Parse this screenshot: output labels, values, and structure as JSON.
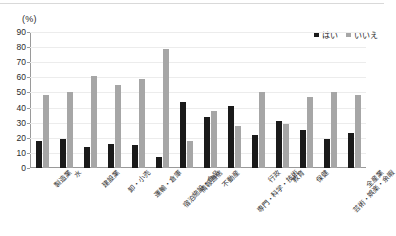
{
  "chart_data": {
    "type": "bar",
    "title": "",
    "subtitle": "",
    "unit_caption": "(%)",
    "xlabel": "",
    "ylabel": "",
    "ylim": [
      0,
      90
    ],
    "ytick_step": 10,
    "yticks": [
      90,
      80,
      70,
      60,
      50,
      40,
      30,
      20,
      10,
      0
    ],
    "grid": true,
    "legend_position": "top-right",
    "categories": [
      "製造業",
      "水",
      "建設業",
      "卸・小売",
      "運輸・倉庫",
      "宿泊施設・食品",
      "情報通信",
      "不動産",
      "専門・科学・技術",
      "行政",
      "教育",
      "保健",
      "芸術・娯楽・余暇",
      "全産業"
    ],
    "series": [
      {
        "name": "はい",
        "color": "#1a1a1a",
        "values": [
          18,
          19,
          14,
          16,
          15,
          7,
          44,
          34,
          41,
          22,
          31,
          25,
          19,
          23
        ]
      },
      {
        "name": "いいえ",
        "color": "#a6a6a6",
        "values": [
          48,
          50,
          61,
          55,
          59,
          79,
          18,
          38,
          28,
          50,
          29,
          47,
          50,
          48
        ]
      }
    ]
  },
  "legend": {
    "items": [
      {
        "label": "はい",
        "color": "#1a1a1a"
      },
      {
        "label": "いいえ",
        "color": "#a6a6a6"
      }
    ]
  }
}
